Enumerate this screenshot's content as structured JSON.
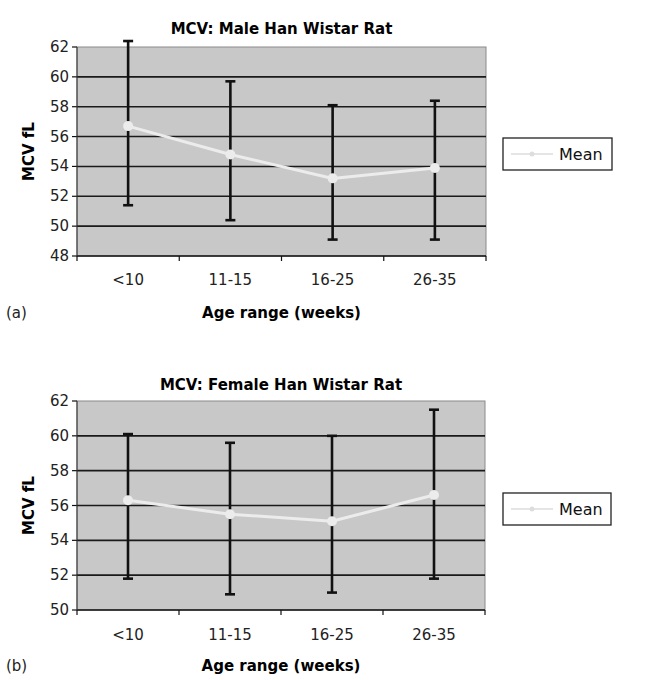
{
  "chart_data": [
    {
      "type": "line",
      "panel_label": "(a)",
      "title": "MCV: Male Han Wistar Rat",
      "xlabel": "Age range (weeks)",
      "ylabel": "MCV fL",
      "categories": [
        "<10",
        "11-15",
        "16-25",
        "26-35"
      ],
      "ylim": [
        48,
        62
      ],
      "yticks": [
        48,
        50,
        52,
        54,
        56,
        58,
        60,
        62
      ],
      "grid": true,
      "legend": "right",
      "series": [
        {
          "name": "Mean",
          "values": [
            56.7,
            54.8,
            53.2,
            53.9
          ],
          "error_upper": [
            62.4,
            59.7,
            58.1,
            58.4
          ],
          "error_lower": [
            51.4,
            50.4,
            49.1,
            49.1
          ]
        }
      ]
    },
    {
      "type": "line",
      "panel_label": "(b)",
      "title": "MCV: Female Han Wistar Rat",
      "xlabel": "Age range (weeks)",
      "ylabel": "MCV fL",
      "categories": [
        "<10",
        "11-15",
        "16-25",
        "26-35"
      ],
      "ylim": [
        50,
        62
      ],
      "yticks": [
        50,
        52,
        54,
        56,
        58,
        60,
        62
      ],
      "grid": true,
      "legend": "right",
      "series": [
        {
          "name": "Mean",
          "values": [
            56.3,
            55.5,
            55.1,
            56.6
          ],
          "error_upper": [
            60.1,
            59.6,
            60.0,
            61.5
          ],
          "error_lower": [
            51.8,
            50.9,
            51.0,
            51.8
          ]
        }
      ]
    }
  ],
  "colors": {
    "plot_bg": "#c8c8c8",
    "grid": "#1a1a1a",
    "error_bar": "#111111",
    "mean_line": "#ececec"
  }
}
